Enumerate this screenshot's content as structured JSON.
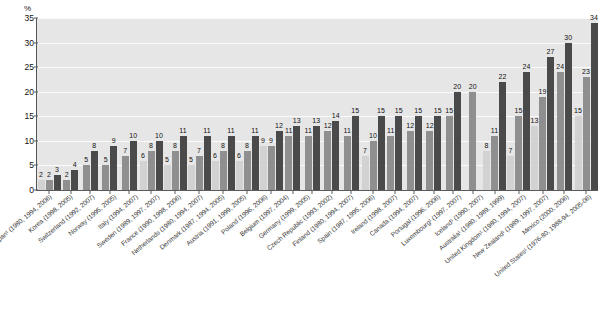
{
  "chart_data": {
    "type": "bar",
    "title": "",
    "xlabel": "",
    "ylabel": "%",
    "ylim": [
      0,
      35
    ],
    "yticks": [
      0,
      5,
      10,
      15,
      20,
      25,
      30,
      35
    ],
    "grid": true,
    "legend_position": "none",
    "series_order": [
      "earliest",
      "middle",
      "latest"
    ],
    "categories": [
      "Japan¹ (1980, 1994, 2006)",
      "Korea (1998, 2005)",
      "Switzerland (1992, 2007)",
      "Norway (1995, 2005)",
      "Italy (1994, 2007)",
      "Sweden (1989, 1997, 2007)",
      "France (1990, 1998, 2006)",
      "Netherlands (1980, 1994, 2007)",
      "Denmark (1987, 1994, 2005)",
      "Austria (1991, 1999, 2005)",
      "Poland (1996, 2006)",
      "Belgium (1997, 2004)",
      "Germany (1999, 2005)",
      "Czech Republic (1993, 2002)",
      "Finland (1980, 1994, 2007)",
      "Spain (1987, 1995, 2006)",
      "Ireland (1998, 2007)",
      "Canada (1994, 2007)",
      "Portugal (1996, 2006)",
      "Luxembourg¹ (1997, 2007)",
      "Iceland¹ (1990, 2007)",
      "Australia¹ (1980, 1989, 1999)",
      "United Kingdom¹ (1980, 1994, 2007)",
      "New Zealand¹ (1989, 1997, 2007)",
      "Mexico (2000, 2006)",
      "United States¹ (1976-80, 1988-94, 2005-06)"
    ],
    "groups": [
      {
        "category": "Japan¹ (1980, 1994, 2006)",
        "values": [
          2,
          2,
          3
        ]
      },
      {
        "category": "Korea (1998, 2005)",
        "values": [
          2,
          4
        ]
      },
      {
        "category": "Switzerland (1992, 2007)",
        "values": [
          5,
          8
        ]
      },
      {
        "category": "Norway (1995, 2005)",
        "values": [
          5,
          9
        ]
      },
      {
        "category": "Italy (1994, 2007)",
        "values": [
          7,
          10
        ]
      },
      {
        "category": "Sweden (1989, 1997, 2007)",
        "values": [
          6,
          8,
          10
        ]
      },
      {
        "category": "France (1990, 1998, 2006)",
        "values": [
          5,
          8,
          11
        ]
      },
      {
        "category": "Netherlands (1980, 1994, 2007)",
        "values": [
          5,
          7,
          11
        ]
      },
      {
        "category": "Denmark (1987, 1994, 2005)",
        "values": [
          6,
          8,
          11
        ]
      },
      {
        "category": "Austria (1991, 1999, 2005)",
        "values": [
          6,
          8,
          11
        ]
      },
      {
        "category": "Poland (1996, 2006)",
        "values": [
          9,
          9,
          12
        ]
      },
      {
        "category": "Belgium (1997, 2004)",
        "values": [
          11,
          13
        ]
      },
      {
        "category": "Germany (1999, 2005)",
        "values": [
          11,
          13
        ]
      },
      {
        "category": "Czech Republic (1993, 2002)",
        "values": [
          12,
          14
        ]
      },
      {
        "category": "Finland (1980, 1994, 2007)",
        "values": [
          11,
          15
        ]
      },
      {
        "category": "Spain (1987, 1995, 2006)",
        "values": [
          7,
          10,
          15
        ]
      },
      {
        "category": "Ireland (1998, 2007)",
        "values": [
          11,
          15
        ]
      },
      {
        "category": "Canada (1994, 2007)",
        "values": [
          12,
          15
        ]
      },
      {
        "category": "Portugal (1996, 2006)",
        "values": [
          12,
          15
        ]
      },
      {
        "category": "Luxembourg¹ (1997, 2007)",
        "values": [
          15,
          20
        ]
      },
      {
        "category": "Iceland¹ (1990, 2007)",
        "values": [
          20
        ]
      },
      {
        "category": "Australia¹ (1980, 1989, 1999)",
        "values": [
          8,
          11,
          22
        ]
      },
      {
        "category": "United Kingdom¹ (1980, 1994, 2007)",
        "values": [
          7,
          15,
          24
        ]
      },
      {
        "category": "New Zealand¹ (1989, 1997, 2007)",
        "values": [
          13,
          19,
          27
        ]
      },
      {
        "category": "Mexico (2000, 2006)",
        "values": [
          24,
          30
        ]
      },
      {
        "category": "United States¹ (1976-80, 1988-94, 2005-06)",
        "values": [
          15,
          23,
          34
        ]
      }
    ],
    "colors": {
      "earliest": "#d2d2d2",
      "middle": "#8f8f8f",
      "latest": "#4a4a4a",
      "plot_background": "#e6e6e6",
      "gridline": "#fbfbfb",
      "axis": "#5a5a5a"
    }
  }
}
